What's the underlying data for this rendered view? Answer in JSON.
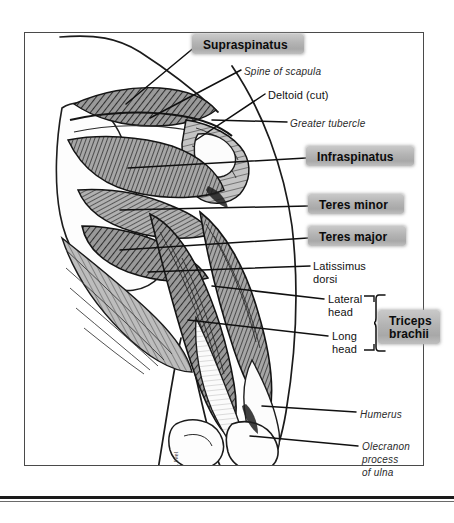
{
  "figure": {
    "style": "grayscale pen-and-ink anatomical illustration",
    "signature": "M. Ivel"
  },
  "labels": [
    {
      "id": "supraspinatus",
      "text": "Supraspinatus",
      "style": "highlighted",
      "x": 196,
      "y": 36,
      "w": 108,
      "h": 19
    },
    {
      "id": "spine-of-scapula",
      "text": "Spine of scapula",
      "style": "italic",
      "x": 244,
      "y": 65
    },
    {
      "id": "deltoid-cut",
      "text": "Deltoid (cut)",
      "style": "plain",
      "x": 268,
      "y": 89
    },
    {
      "id": "greater-tubercle",
      "text": "Greater tubercle",
      "style": "italic",
      "x": 290,
      "y": 117
    },
    {
      "id": "infraspinatus",
      "text": "Infraspinatus",
      "style": "highlighted",
      "x": 310,
      "y": 148,
      "w": 104,
      "h": 19
    },
    {
      "id": "teres-minor",
      "text": "Teres minor",
      "style": "highlighted",
      "x": 312,
      "y": 196,
      "w": 92,
      "h": 19
    },
    {
      "id": "teres-major",
      "text": "Teres major",
      "style": "highlighted",
      "x": 312,
      "y": 228,
      "w": 94,
      "h": 19
    },
    {
      "id": "latissimus-dorsi",
      "text": "Latissimus\ndorsi",
      "style": "plain",
      "x": 313,
      "y": 260
    },
    {
      "id": "lateral-head",
      "text": "Lateral\nhead",
      "style": "plain",
      "x": 328,
      "y": 293
    },
    {
      "id": "long-head",
      "text": "Long\nhead",
      "style": "plain",
      "x": 332,
      "y": 330
    },
    {
      "id": "triceps-brachii",
      "text": "Triceps\nbrachii",
      "style": "highlighted",
      "x": 382,
      "y": 312,
      "w": 56,
      "h": 32
    },
    {
      "id": "humerus",
      "text": "Humerus",
      "style": "italic",
      "x": 360,
      "y": 408
    },
    {
      "id": "olecranon-process-of-ulna",
      "text": "Olecranon\nprocess\nof ulna",
      "style": "italic",
      "x": 362,
      "y": 440
    }
  ],
  "colors": {
    "ink": "#111111",
    "frame": "#4a4a4a",
    "highlight": "#b3b3b3",
    "muscle_dark": "#6e6e6e",
    "muscle_mid": "#8d8d8d",
    "tendon_light": "#f4f4f4"
  },
  "brace": {
    "name": "triceps-brachii-brace",
    "x": 374,
    "y": 296,
    "h": 54
  }
}
